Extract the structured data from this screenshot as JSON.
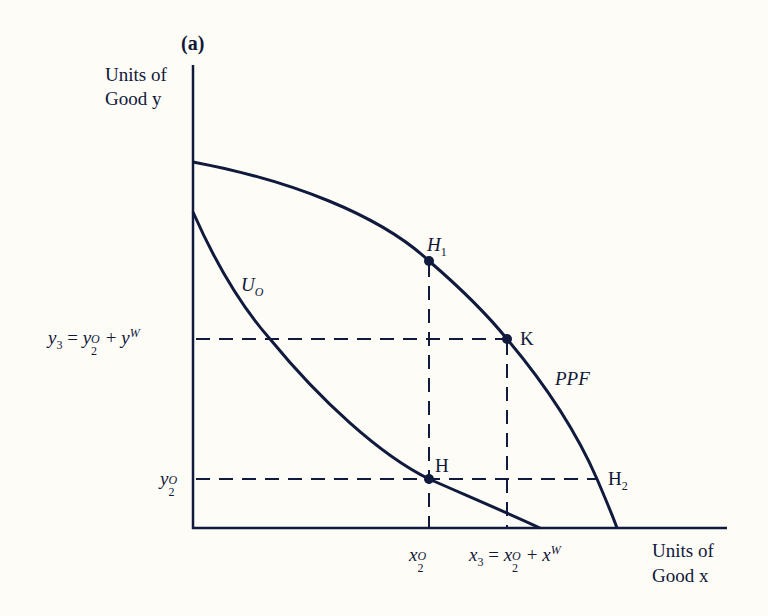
{
  "figure": {
    "panel_label": "(a)",
    "y_axis_label_line1": "Units of",
    "y_axis_label_line2": "Good y",
    "x_axis_label_line1": "Units of",
    "x_axis_label_line2": "Good x",
    "curves": {
      "ppf_label": "PPF",
      "indifference_label": "U",
      "indifference_sub": "O"
    },
    "points": {
      "h1": {
        "base": "H",
        "sub": "1"
      },
      "k": {
        "base": "K"
      },
      "h": {
        "base": "H"
      },
      "h2": {
        "base": "H",
        "sub": "2"
      }
    },
    "y_ticks": {
      "y3": {
        "lhs": "y",
        "lhs_sub": "3",
        "eq": " = ",
        "a": "y",
        "a_sup": "O",
        "a_sub": "2",
        "plus": " + ",
        "b": "y",
        "b_sup": "W"
      },
      "y2": {
        "base": "y",
        "sup": "O",
        "sub": "2"
      }
    },
    "x_ticks": {
      "x2": {
        "base": "x",
        "sup": "O",
        "sub": "2"
      },
      "x3": {
        "lhs": "x",
        "lhs_sub": "3",
        "eq": " = ",
        "a": "x",
        "a_sup": "O",
        "a_sub": "2",
        "plus": " + ",
        "b": "x",
        "b_sup": "W"
      }
    },
    "colors": {
      "ink": "#0f1a3d",
      "background": "#fdfcf6"
    }
  }
}
